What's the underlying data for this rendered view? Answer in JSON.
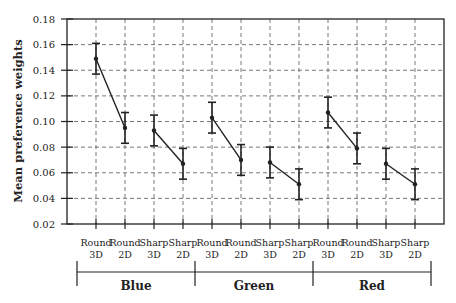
{
  "chart_data": {
    "type": "line",
    "title": "",
    "xlabel": "",
    "ylabel": "Mean preference weights",
    "ylim": [
      0.02,
      0.18
    ],
    "yticks": [
      0.02,
      0.04,
      0.06,
      0.08,
      0.1,
      0.12,
      0.14,
      0.16,
      0.18
    ],
    "ytick_labels": [
      "0.02",
      "0.04",
      "0.06",
      "0.08",
      "0.10",
      "0.12",
      "0.14",
      "0.16",
      "0.18"
    ],
    "grid": true,
    "grid_style": "dashed",
    "legend": null,
    "error_bars": true,
    "groups": [
      {
        "name": "Blue",
        "categories": [
          {
            "line1": "Round",
            "line2": "3D"
          },
          {
            "line1": "Round",
            "line2": "2D"
          },
          {
            "line1": "Sharp",
            "line2": "3D"
          },
          {
            "line1": "Sharp",
            "line2": "2D"
          }
        ],
        "segments": [
          {
            "shape": "Round",
            "values": [
              0.149,
              0.095
            ],
            "errors": [
              0.012,
              0.012
            ]
          },
          {
            "shape": "Sharp",
            "values": [
              0.093,
              0.067
            ],
            "errors": [
              0.012,
              0.012
            ]
          }
        ]
      },
      {
        "name": "Green",
        "categories": [
          {
            "line1": "Round",
            "line2": "3D"
          },
          {
            "line1": "Round",
            "line2": "2D"
          },
          {
            "line1": "Sharp",
            "line2": "3D"
          },
          {
            "line1": "Sharp",
            "line2": "2D"
          }
        ],
        "segments": [
          {
            "shape": "Round",
            "values": [
              0.103,
              0.07
            ],
            "errors": [
              0.012,
              0.012
            ]
          },
          {
            "shape": "Sharp",
            "values": [
              0.068,
              0.051
            ],
            "errors": [
              0.012,
              0.012
            ]
          }
        ]
      },
      {
        "name": "Red",
        "categories": [
          {
            "line1": "Round",
            "line2": "3D"
          },
          {
            "line1": "Round",
            "line2": "2D"
          },
          {
            "line1": "Sharp",
            "line2": "3D"
          },
          {
            "line1": "Sharp",
            "line2": "2D"
          }
        ],
        "segments": [
          {
            "shape": "Round",
            "values": [
              0.107,
              0.079
            ],
            "errors": [
              0.012,
              0.012
            ]
          },
          {
            "shape": "Sharp",
            "values": [
              0.067,
              0.051
            ],
            "errors": [
              0.012,
              0.012
            ]
          }
        ]
      }
    ],
    "categories": [
      "Round 3D",
      "Round 2D",
      "Sharp 3D",
      "Sharp 2D",
      "Round 3D",
      "Round 2D",
      "Sharp 3D",
      "Sharp 2D",
      "Round 3D",
      "Round 2D",
      "Sharp 3D",
      "Sharp 2D"
    ],
    "values": [
      0.149,
      0.095,
      0.093,
      0.067,
      0.103,
      0.07,
      0.068,
      0.051,
      0.107,
      0.079,
      0.067,
      0.051
    ],
    "colors": {
      "line": "#222222",
      "axis": "#222222",
      "grid": "#555555",
      "background": "#ffffff"
    }
  }
}
